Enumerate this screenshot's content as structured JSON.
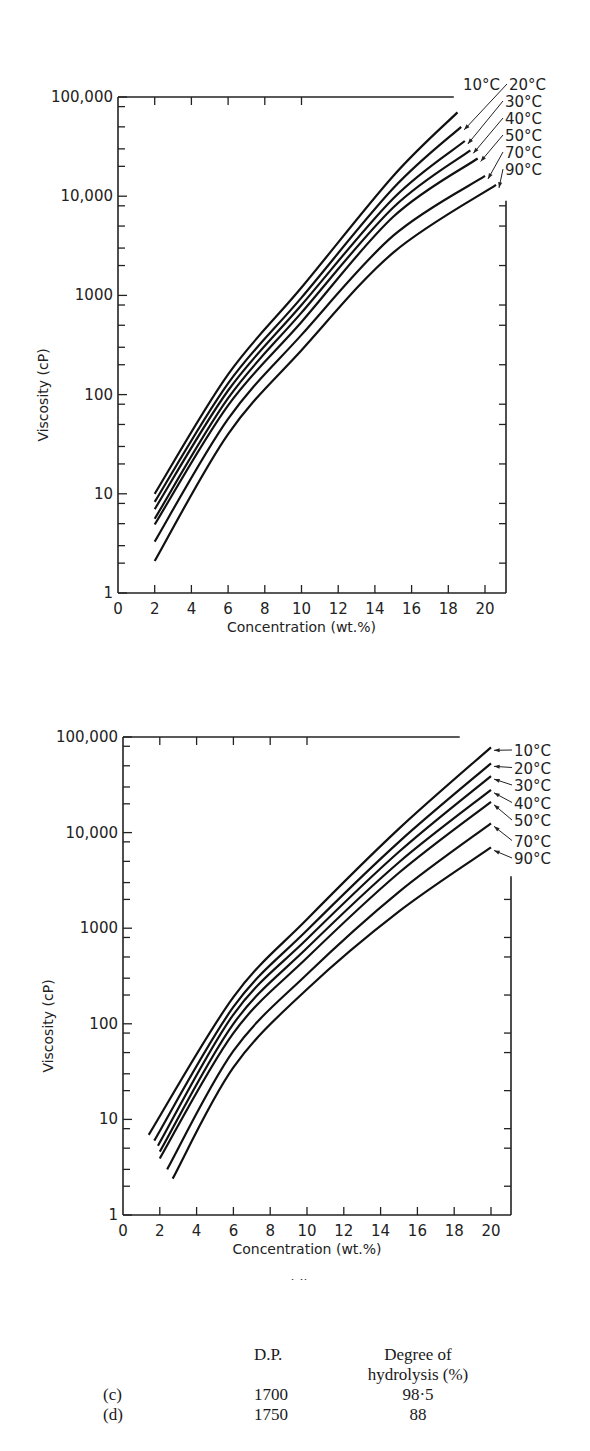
{
  "chart_data": [
    {
      "id": "c",
      "type": "line",
      "panel_label": "(c)",
      "title": "",
      "xlabel": "Concentration (wt.%)",
      "ylabel": "Viscosity (cP)",
      "yscale": "log",
      "xlim": [
        0,
        21
      ],
      "ylim": [
        1,
        100000
      ],
      "x_ticks": [
        "0",
        "2",
        "4",
        "6",
        "8",
        "10",
        "12",
        "14",
        "16",
        "18",
        "20"
      ],
      "y_ticks": [
        "1",
        "10",
        "100",
        "1000",
        "10,000",
        "100,000"
      ],
      "grid": false,
      "legend_position": "inline-right-top",
      "series": [
        {
          "name": "10°C",
          "points": [
            [
              2,
              10
            ],
            [
              6,
              160
            ],
            [
              10,
              1200
            ],
            [
              15,
              16000
            ],
            [
              18.5,
              70000
            ]
          ]
        },
        {
          "name": "20°C",
          "points": [
            [
              2,
              8.3
            ],
            [
              6,
              130
            ],
            [
              10,
              950
            ],
            [
              15,
              12000
            ],
            [
              18.7,
              50000
            ]
          ]
        },
        {
          "name": "30°C",
          "points": [
            [
              2,
              7
            ],
            [
              6,
              110
            ],
            [
              10,
              800
            ],
            [
              15,
              9500
            ],
            [
              18.9,
              36000
            ]
          ]
        },
        {
          "name": "40°C",
          "points": [
            [
              2,
              5.6
            ],
            [
              6,
              92
            ],
            [
              10,
              670
            ],
            [
              15,
              7700
            ],
            [
              19.2,
              29000
            ]
          ]
        },
        {
          "name": "50°C",
          "points": [
            [
              2,
              4.9
            ],
            [
              6,
              78
            ],
            [
              10,
              540
            ],
            [
              15,
              6200
            ],
            [
              19.6,
              24000
            ]
          ]
        },
        {
          "name": "70°C",
          "points": [
            [
              2,
              3.3
            ],
            [
              6,
              57
            ],
            [
              10,
              400
            ],
            [
              15,
              4000
            ],
            [
              20.0,
              16000
            ]
          ]
        },
        {
          "name": "90°C",
          "points": [
            [
              2,
              2.1
            ],
            [
              6,
              40
            ],
            [
              10,
              280
            ],
            [
              15,
              2700
            ],
            [
              20.6,
              13000
            ]
          ]
        }
      ]
    },
    {
      "id": "d",
      "type": "line",
      "panel_label": "(d)",
      "title": "",
      "xlabel": "Concentration  (wt.%)",
      "ylabel": "Viscosity (cP)",
      "yscale": "log",
      "xlim": [
        0,
        21
      ],
      "ylim": [
        1,
        100000
      ],
      "x_ticks": [
        "0",
        "2",
        "4",
        "6",
        "8",
        "10",
        "12",
        "14",
        "16",
        "18",
        "20"
      ],
      "y_ticks": [
        "1",
        "10",
        "100",
        "1000",
        "10,000",
        "100,000"
      ],
      "grid": false,
      "legend_position": "inline-right-top",
      "series": [
        {
          "name": "10°C",
          "points": [
            [
              1.4,
              6.9
            ],
            [
              6,
              190
            ],
            [
              10,
              1240
            ],
            [
              15,
              11000
            ],
            [
              20,
              78000
            ]
          ]
        },
        {
          "name": "20°C",
          "points": [
            [
              1.7,
              6.0
            ],
            [
              6,
              150
            ],
            [
              10,
              950
            ],
            [
              15,
              8000
            ],
            [
              20,
              53000
            ]
          ]
        },
        {
          "name": "30°C",
          "points": [
            [
              1.9,
              5.3
            ],
            [
              6,
              125
            ],
            [
              10,
              770
            ],
            [
              15,
              6300
            ],
            [
              20,
              39000
            ]
          ]
        },
        {
          "name": "40°C",
          "points": [
            [
              2.0,
              4.6
            ],
            [
              6,
              100
            ],
            [
              10,
              620
            ],
            [
              15,
              4900
            ],
            [
              20,
              28000
            ]
          ]
        },
        {
          "name": "50°C",
          "points": [
            [
              2.0,
              3.9
            ],
            [
              6,
              80
            ],
            [
              10,
              490
            ],
            [
              15,
              3800
            ],
            [
              20,
              21000
            ]
          ]
        },
        {
          "name": "70°C",
          "points": [
            [
              2.4,
              3.0
            ],
            [
              6,
              52
            ],
            [
              10,
              330
            ],
            [
              15,
              2400
            ],
            [
              20,
              12500
            ]
          ]
        },
        {
          "name": "90°C",
          "points": [
            [
              2.7,
              2.4
            ],
            [
              6,
              35
            ],
            [
              10,
              230
            ],
            [
              15,
              1500
            ],
            [
              20,
              7000
            ]
          ]
        }
      ]
    }
  ],
  "table": {
    "headers": [
      "",
      "D.P.",
      "Degree of"
    ],
    "header_line2": "hydrolysis (%)",
    "rows": [
      {
        "sample": "(c)",
        "dp": "1700",
        "hydrolysis": "98·5"
      },
      {
        "sample": "(d)",
        "dp": "1750",
        "hydrolysis": "88"
      }
    ]
  }
}
